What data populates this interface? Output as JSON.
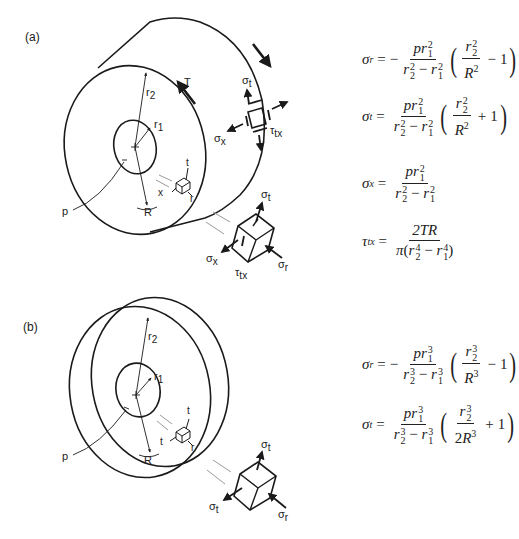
{
  "figure": {
    "panels": [
      {
        "id": "a",
        "label": "(a)",
        "object": "thick-walled cylinder",
        "diagram_labels": {
          "outer_radius": "r2",
          "inner_radius": "r1",
          "radius_point": "R",
          "pressure": "p",
          "torque": "T",
          "small_element_axes": [
            "t",
            "x",
            "r"
          ],
          "surface_element_stresses": [
            "σt",
            "σx",
            "τtx"
          ],
          "exploded_element_stresses": [
            "σt",
            "σx",
            "τtx",
            "σr"
          ]
        },
        "equations": [
          {
            "lhs": "σ_r",
            "text": "σr = −(p r1²)/(r2² − r1²) · (r2²/R² − 1)"
          },
          {
            "lhs": "σ_t",
            "text": "σt = (p r1²)/(r2² − r1²) · (r2²/R² + 1)"
          },
          {
            "lhs": "σ_x",
            "text": "σx = (p r1²)/(r2² − r1²)"
          },
          {
            "lhs": "τ_tx",
            "text": "τtx = 2TR / (π(r2⁴ − r1⁴))"
          }
        ]
      },
      {
        "id": "b",
        "label": "(b)",
        "object": "thick disk / sphere section",
        "diagram_labels": {
          "outer_radius": "r2",
          "inner_radius": "r1",
          "radius_point": "R",
          "pressure": "p",
          "small_element_axes": [
            "t",
            "t",
            "r"
          ],
          "exploded_element_stresses": [
            "σt",
            "σt",
            "σr"
          ]
        },
        "equations": [
          {
            "lhs": "σ_r",
            "text": "σr = −(p r1³)/(r2³ − r1³) · (r2³/R³ − 1)"
          },
          {
            "lhs": "σ_t",
            "text": "σt = (p r1³)/(r2³ − r1³) · (r2³/(2R³) + 1)"
          }
        ]
      }
    ],
    "text": {
      "a": "(a)",
      "b": "(b)",
      "r2": "r",
      "r2sub": "2",
      "r1": "r",
      "r1sub": "1",
      "R": "R",
      "p": "p",
      "T": "T",
      "t": "t",
      "x": "x",
      "r": "r",
      "sigma": "σ",
      "tau": "τ",
      "sub_t": "t",
      "sub_x": "x",
      "sub_r": "r",
      "sub_tx": "tx",
      "minus": "−",
      "plus": "+",
      "eq": "=",
      "one": "1",
      "two": "2",
      "pi": "π",
      "TR": "2TR",
      "pr": "pr",
      "exp2": "2",
      "exp3": "3",
      "exp4": "4",
      "sub1": "1",
      "sub2": "2"
    },
    "colors": {
      "line": "#1a1a1a",
      "leader": "#9a9a9a",
      "background": "#ffffff"
    }
  }
}
